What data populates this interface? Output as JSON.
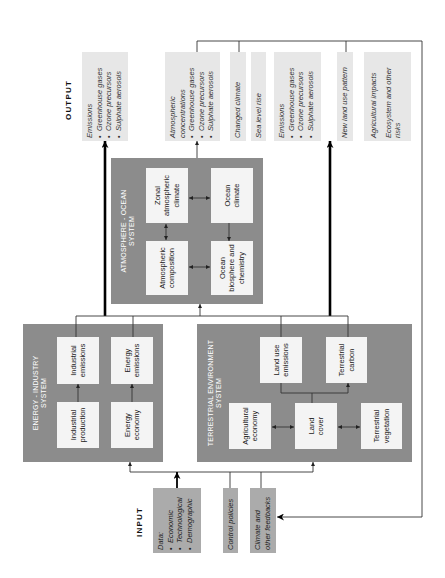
{
  "labels": {
    "output": "OUTPUT",
    "input": "INPUT"
  },
  "outputs": [
    {
      "heading": "Emissions",
      "bullets": [
        "Greenhouse gases",
        "Ozone precursors",
        "Sulphate aerosols"
      ]
    },
    {
      "heading_lines": [
        "Atmospheric",
        "concentrations"
      ],
      "bullets": [
        "Greenhouse gases",
        "Ozone precursors",
        "Sulphate aerosols"
      ]
    },
    {
      "heading": "Changed climate"
    },
    {
      "heading": "Sea level rise"
    },
    {
      "heading": "Emissions",
      "bullets": [
        "Greenhouse gases",
        "Ozone precursors",
        "Sulphate aerosols"
      ]
    },
    {
      "heading": "New land use pattern"
    },
    {
      "paragraphs": [
        [
          "Agricultural impacts"
        ],
        [
          "Ecosystem and other",
          "risks"
        ]
      ]
    }
  ],
  "systems": {
    "atmosphere_ocean": {
      "title_lines": [
        "ATMOSPHERE - OCEAN",
        "SYSTEM"
      ],
      "components": [
        {
          "lines": [
            "Zonal",
            "atmospheric",
            "climate"
          ]
        },
        {
          "lines": [
            "Ocean",
            "climate"
          ]
        },
        {
          "lines": [
            "Atmospheric",
            "composition"
          ]
        },
        {
          "lines": [
            "Ocean",
            "biosphere and",
            "chemistry"
          ]
        }
      ]
    },
    "energy_industry": {
      "title_lines": [
        "ENERGY - INDUSTRY",
        "SYSTEM"
      ],
      "components": [
        {
          "lines": [
            "Industrial",
            "emissions"
          ]
        },
        {
          "lines": [
            "Energy",
            "emissions"
          ]
        },
        {
          "lines": [
            "Industrial",
            "production"
          ]
        },
        {
          "lines": [
            "Energy",
            "economy"
          ]
        }
      ]
    },
    "terrestrial_environment": {
      "title_lines": [
        "TERRESTRIAL ENVIRONMENT",
        "SYSTEM"
      ],
      "components": [
        {
          "lines": [
            "Land use",
            "emissions"
          ]
        },
        {
          "lines": [
            "Terrestrial",
            "carbon"
          ]
        },
        {
          "lines": [
            "Agricultural",
            "economy"
          ]
        },
        {
          "lines": [
            "Land",
            "cover"
          ]
        },
        {
          "lines": [
            "Terrestrial",
            "vegetation"
          ]
        }
      ]
    }
  },
  "inputs": [
    {
      "heading": "Data:",
      "bullets": [
        "Economic",
        "Technological",
        "Demographic"
      ]
    },
    {
      "lines": [
        "Control policies"
      ]
    },
    {
      "lines": [
        "Climate and",
        "other feedbacks"
      ]
    }
  ],
  "colors": {
    "system_box": "#8c8c8c",
    "component_box": "#f4f4f4",
    "output_box": "#e7e7e7",
    "input_box": "#ababab",
    "connector": "#333333"
  }
}
